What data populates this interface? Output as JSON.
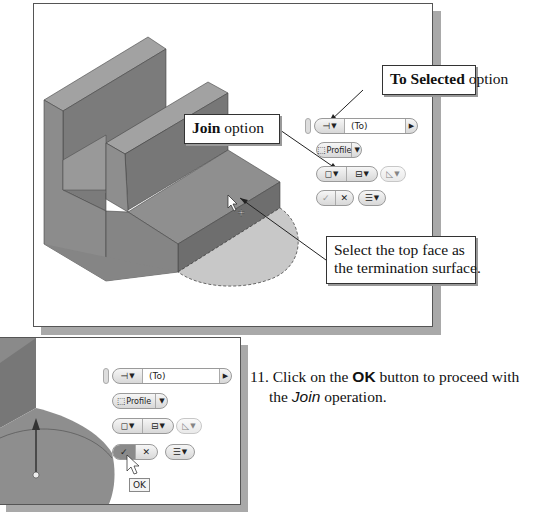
{
  "figure_top": {
    "callouts": {
      "to_selected": {
        "bold": "To Selected",
        "rest": " option"
      },
      "join": {
        "bold": "Join",
        "rest": " option"
      },
      "select_face": {
        "line1": "Select the top face as",
        "line2": "the termination surface."
      }
    },
    "mini_toolbar": {
      "extent_value": "(To)",
      "profile_label": "Profile"
    }
  },
  "figure_bottom": {
    "mini_toolbar": {
      "extent_value": "(To)",
      "profile_label": "Profile"
    },
    "tooltip": "OK"
  },
  "step": {
    "number": "11.",
    "text_before": " Click on the ",
    "bold": "OK",
    "text_after": " button to proceed with",
    "line2_before": "the ",
    "italic": "Join",
    "line2_after": " operation."
  },
  "colors": {
    "part_top": "#8f8f8f",
    "part_front": "#6f6f6f",
    "part_side": "#7c7c7c",
    "preview": "#c6c6c6",
    "frame_shadow": "#a9a9a9"
  }
}
